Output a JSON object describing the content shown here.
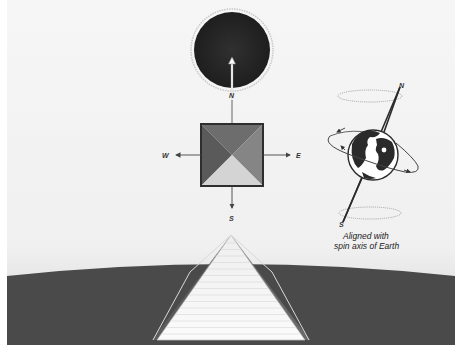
{
  "diagram": {
    "compass": {
      "north_label": "N",
      "south_label": "S",
      "east_label": "E",
      "west_label": "W"
    },
    "earth": {
      "axis_north_label": "N",
      "axis_south_label": "S",
      "caption_line1": "Aligned with",
      "caption_line2": "spin axis of Earth"
    },
    "icons": {
      "sun": "pole-star-disc",
      "pyramid_top_view": "pyramid-plan-square",
      "earth": "globe",
      "pyramid": "pyramid-elevation"
    },
    "colors": {
      "sky_top": "#f4f4f4",
      "sky_horizon": "#dcdcdc",
      "ground": "#4a4a4a",
      "disc": "#2a2a2a",
      "pyramid_face": "#f7f7f7",
      "pyramid_edge": "#6a6a6a",
      "plan_top": "#6d6d6d",
      "plan_left": "#5a5a5a",
      "plan_right": "#858585",
      "plan_bottom": "#d4d4d4"
    }
  }
}
